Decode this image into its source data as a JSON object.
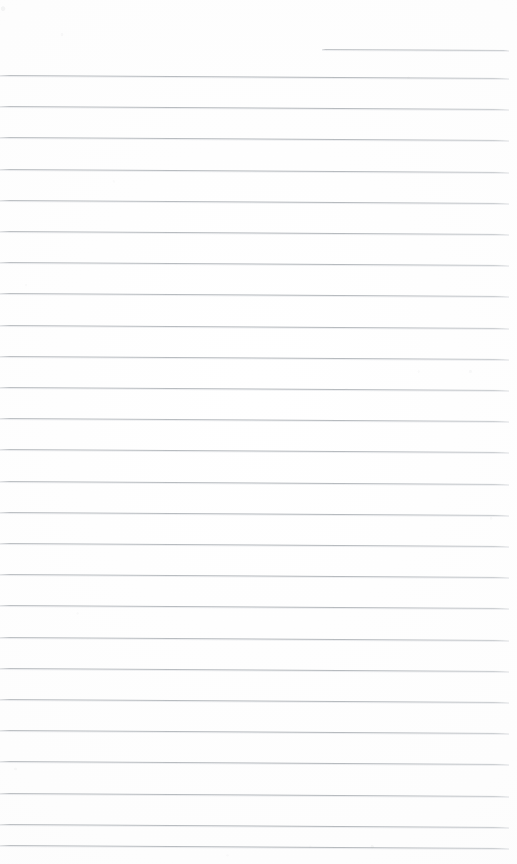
{
  "document": {
    "kind": "scanned-ruled-paper",
    "title": "Blank ruled notepad page",
    "page_width": 517,
    "page_height": 864,
    "background_color": "#fdfdfd",
    "has_text_content": false,
    "visible_text": "",
    "notes": "Blank lined paper scan: no headings, labels, handwriting or printed text visible anywhere on the page."
  },
  "ruling": {
    "line_color": "#b9bdc1",
    "line_thickness_px": 1,
    "line_spacing_px": 31.2,
    "left_margin_px": 0,
    "right_edge_px": 509,
    "slant_drop_px": 3,
    "full_line_count": 25,
    "partial_line_count": 1,
    "first_full_line_y": 75,
    "last_full_line_y": 845
  },
  "lines": [
    {
      "id": "rule-partial-top",
      "y": 49,
      "x": 322,
      "width": 187,
      "partial": true
    },
    {
      "id": "rule-01",
      "y": 75.0,
      "x": 0,
      "width": 509,
      "partial": false
    },
    {
      "id": "rule-02",
      "y": 106.2,
      "x": 0,
      "width": 509,
      "partial": false
    },
    {
      "id": "rule-03",
      "y": 137.4,
      "x": 0,
      "width": 509,
      "partial": false
    },
    {
      "id": "rule-04",
      "y": 168.6,
      "x": 0,
      "width": 509,
      "partial": false
    },
    {
      "id": "rule-05",
      "y": 199.8,
      "x": 0,
      "width": 509,
      "partial": false
    },
    {
      "id": "rule-06",
      "y": 231.0,
      "x": 0,
      "width": 509,
      "partial": false
    },
    {
      "id": "rule-07",
      "y": 262.2,
      "x": 0,
      "width": 509,
      "partial": false
    },
    {
      "id": "rule-08",
      "y": 293.4,
      "x": 0,
      "width": 509,
      "partial": false
    },
    {
      "id": "rule-09",
      "y": 324.6,
      "x": 0,
      "width": 509,
      "partial": false
    },
    {
      "id": "rule-10",
      "y": 355.8,
      "x": 0,
      "width": 509,
      "partial": false
    },
    {
      "id": "rule-11",
      "y": 387.0,
      "x": 0,
      "width": 509,
      "partial": false
    },
    {
      "id": "rule-12",
      "y": 418.2,
      "x": 0,
      "width": 509,
      "partial": false
    },
    {
      "id": "rule-13",
      "y": 449.4,
      "x": 0,
      "width": 509,
      "partial": false
    },
    {
      "id": "rule-14",
      "y": 480.6,
      "x": 0,
      "width": 509,
      "partial": false
    },
    {
      "id": "rule-15",
      "y": 511.8,
      "x": 0,
      "width": 509,
      "partial": false
    },
    {
      "id": "rule-16",
      "y": 543.0,
      "x": 0,
      "width": 509,
      "partial": false
    },
    {
      "id": "rule-17",
      "y": 574.2,
      "x": 0,
      "width": 509,
      "partial": false
    },
    {
      "id": "rule-18",
      "y": 605.4,
      "x": 0,
      "width": 509,
      "partial": false
    },
    {
      "id": "rule-19",
      "y": 636.6,
      "x": 0,
      "width": 509,
      "partial": false
    },
    {
      "id": "rule-20",
      "y": 667.8,
      "x": 0,
      "width": 509,
      "partial": false
    },
    {
      "id": "rule-21",
      "y": 699.0,
      "x": 0,
      "width": 509,
      "partial": false
    },
    {
      "id": "rule-22",
      "y": 730.2,
      "x": 0,
      "width": 509,
      "partial": false
    },
    {
      "id": "rule-23",
      "y": 761.4,
      "x": 0,
      "width": 509,
      "partial": false
    },
    {
      "id": "rule-24",
      "y": 792.6,
      "x": 0,
      "width": 509,
      "partial": false
    },
    {
      "id": "rule-25",
      "y": 823.8,
      "x": 0,
      "width": 509,
      "partial": false
    },
    {
      "id": "rule-26",
      "y": 845.0,
      "x": 0,
      "width": 509,
      "partial": false
    }
  ]
}
